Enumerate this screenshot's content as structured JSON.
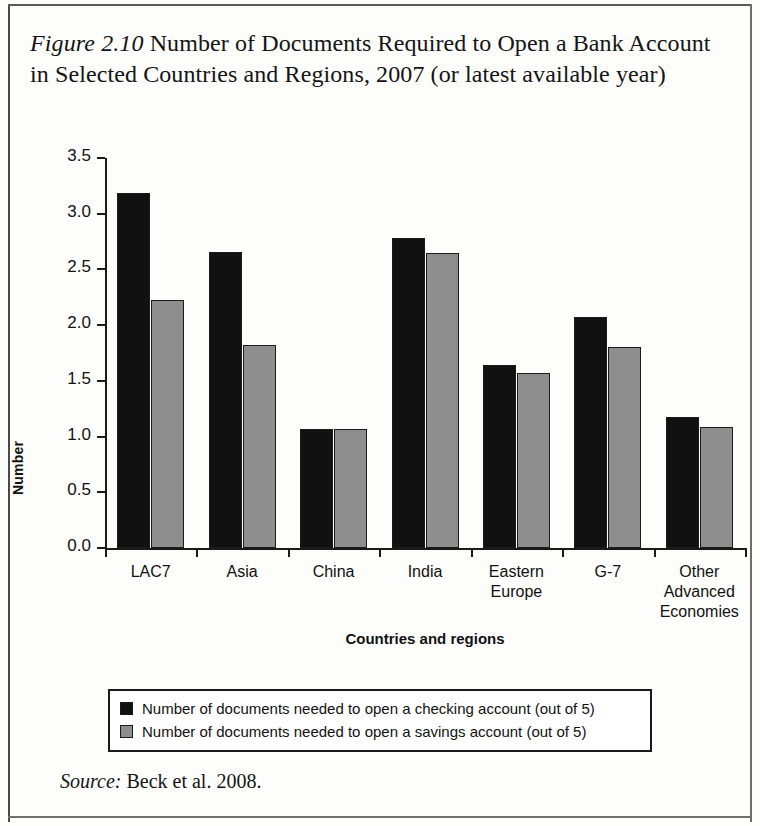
{
  "figure": {
    "number_label": "Figure 2.10",
    "title_text": " Number of Documents Required to Open a Bank Account in Selected Countries and Regions, 2007 (or latest available year)",
    "source_label": "Source:",
    "source_text": " Beck et al. 2008."
  },
  "chart_data": {
    "type": "bar",
    "title": "Figure 2.10 Number of Documents Required to Open a Bank Account in Selected Countries and Regions, 2007 (or latest available year)",
    "xlabel": "Countries and regions",
    "ylabel": "Number",
    "ylim": [
      0.0,
      3.5
    ],
    "ytick_labels": [
      "0.0",
      "0.5",
      "1.0",
      "1.5",
      "2.0",
      "2.5",
      "3.0",
      "3.5"
    ],
    "ytick_values": [
      0.0,
      0.5,
      1.0,
      1.5,
      2.0,
      2.5,
      3.0,
      3.5
    ],
    "grid": false,
    "legend_position": "below-plot",
    "categories": [
      "LAC7",
      "Asia",
      "China",
      "India",
      "Eastern\nEurope",
      "G-7",
      "Other\nAdvanced\nEconomies"
    ],
    "series": [
      {
        "name": "Number of documents needed to open a checking account (out of 5)",
        "color": "#111111",
        "values": [
          3.19,
          2.66,
          1.07,
          2.78,
          1.64,
          2.07,
          1.18
        ]
      },
      {
        "name": "Number of documents needed to open a savings account (out of 5)",
        "color": "#8e8e8e",
        "values": [
          2.23,
          1.82,
          1.07,
          2.65,
          1.57,
          1.8,
          1.09
        ]
      }
    ]
  }
}
